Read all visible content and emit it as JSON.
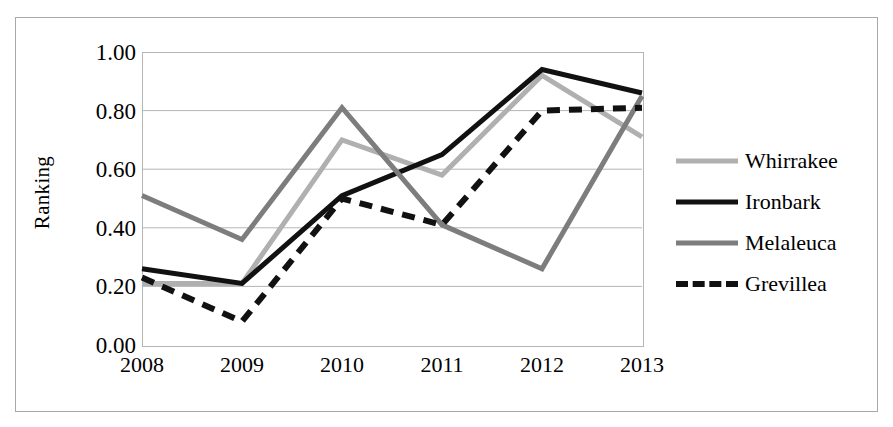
{
  "figure": {
    "y_axis_title": "Ranking",
    "background": "#ffffff",
    "frame_color": "#a8a8a8",
    "gridline_color": "#b5b5b5"
  },
  "chart_data": {
    "type": "line",
    "title": "",
    "xlabel": "",
    "ylabel": "Ranking",
    "categories": [
      "2008",
      "2009",
      "2010",
      "2011",
      "2012",
      "2013"
    ],
    "x": [
      2008,
      2009,
      2010,
      2011,
      2012,
      2013
    ],
    "ylim": [
      0.0,
      1.0
    ],
    "xlim": [
      2008,
      2013
    ],
    "ytick_labels": [
      "1.00",
      "0.80",
      "0.60",
      "0.40",
      "0.20",
      "0.00"
    ],
    "ytick_values": [
      1.0,
      0.8,
      0.6,
      0.4,
      0.2,
      0.0
    ],
    "grid": true,
    "grid_axis": "y",
    "legend_position": "right",
    "series": [
      {
        "name": "Whirrakee",
        "values": [
          0.21,
          0.21,
          0.7,
          0.58,
          0.92,
          0.71
        ],
        "color": "#b0b0b0",
        "style": "solid",
        "width": 5
      },
      {
        "name": "Ironbark",
        "values": [
          0.26,
          0.21,
          0.51,
          0.65,
          0.94,
          0.86
        ],
        "color": "#111111",
        "style": "solid",
        "width": 5
      },
      {
        "name": "Melaleuca",
        "values": [
          0.51,
          0.36,
          0.81,
          0.41,
          0.26,
          0.85
        ],
        "color": "#7d7d7d",
        "style": "solid",
        "width": 5
      },
      {
        "name": "Grevillea",
        "values": [
          0.23,
          0.08,
          0.5,
          0.41,
          0.8,
          0.81
        ],
        "color": "#111111",
        "style": "dashed",
        "width": 6
      }
    ]
  },
  "legend": {
    "entries": [
      {
        "label": "Whirrakee"
      },
      {
        "label": "Ironbark"
      },
      {
        "label": "Melaleuca"
      },
      {
        "label": "Grevillea"
      }
    ]
  }
}
